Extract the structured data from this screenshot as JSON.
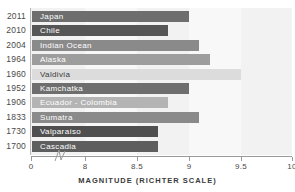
{
  "chart_data": {
    "type": "bar",
    "orientation": "horizontal",
    "title": "",
    "xlabel": "MAGNITUDE (RICHTER SCALE)",
    "ylabel": "",
    "xlim": [
      0,
      10
    ],
    "axis_break": true,
    "axis_break_between": [
      0,
      8
    ],
    "grid": false,
    "legend": "none",
    "xticks": [
      "0",
      "8",
      "8.5",
      "9",
      "9.5",
      "10"
    ],
    "xtick_values": [
      0,
      8,
      8.5,
      9,
      9.5,
      10
    ],
    "categories": [
      "Japan",
      "Chile",
      "Indian Ocean",
      "Alaska",
      "Valdivia",
      "Kamchatka",
      "Ecuador - Colombia",
      "Sumatra",
      "Valparaíso",
      "Cascadia"
    ],
    "years": [
      "2011",
      "2010",
      "2004",
      "1964",
      "1960",
      "1952",
      "1906",
      "1833",
      "1730",
      "1700"
    ],
    "values": [
      9.0,
      8.8,
      9.1,
      9.2,
      9.5,
      9.0,
      8.8,
      9.1,
      8.7,
      8.7
    ],
    "bars": [
      {
        "year": "2011",
        "label": "Japan",
        "value": 9.0,
        "color": "#6e6e6e",
        "label_color": "light"
      },
      {
        "year": "2010",
        "label": "Chile",
        "value": 8.8,
        "color": "#565656",
        "label_color": "light"
      },
      {
        "year": "2004",
        "label": "Indian Ocean",
        "value": 9.1,
        "color": "#8a8a8a",
        "label_color": "light"
      },
      {
        "year": "1964",
        "label": "Alaska",
        "value": 9.2,
        "color": "#9d9d9d",
        "label_color": "light"
      },
      {
        "year": "1960",
        "label": "Valdivia",
        "value": 9.5,
        "color": "#dcdcdc",
        "label_color": "dark"
      },
      {
        "year": "1952",
        "label": "Kamchatka",
        "value": 9.0,
        "color": "#6e6e6e",
        "label_color": "light"
      },
      {
        "year": "1906",
        "label": "Ecuador - Colombia",
        "value": 8.8,
        "color": "#b4b4b4",
        "label_color": "light"
      },
      {
        "year": "1833",
        "label": "Sumatra",
        "value": 9.1,
        "color": "#8a8a8a",
        "label_color": "light"
      },
      {
        "year": "1730",
        "label": "Valparaíso",
        "value": 8.7,
        "color": "#4f4f4f",
        "label_color": "light"
      },
      {
        "year": "1700",
        "label": "Cascadia",
        "value": 8.7,
        "color": "#5e5e5e",
        "label_color": "light"
      }
    ],
    "colors": {
      "background": "#ffffff",
      "band_light": "#f2f2f2",
      "band_lighter": "#f8f8f8",
      "axis": "#9a9a9a",
      "text": "#3a3a3a"
    }
  }
}
